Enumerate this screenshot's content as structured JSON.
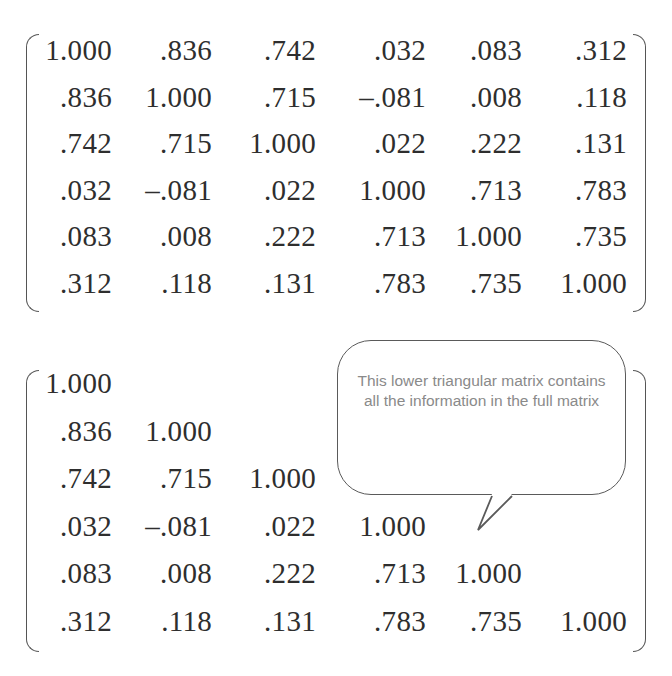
{
  "full_matrix": {
    "rows": [
      [
        "1.000",
        ".836",
        ".742",
        ".032",
        ".083",
        ".312"
      ],
      [
        ".836",
        "1.000",
        ".715",
        "–.081",
        ".008",
        ".118"
      ],
      [
        ".742",
        ".715",
        "1.000",
        ".022",
        ".222",
        ".131"
      ],
      [
        ".032",
        "–.081",
        ".022",
        "1.000",
        ".713",
        ".783"
      ],
      [
        ".083",
        ".008",
        ".222",
        ".713",
        "1.000",
        ".735"
      ],
      [
        ".312",
        ".118",
        ".131",
        ".783",
        ".735",
        "1.000"
      ]
    ]
  },
  "lower_triangular_matrix": {
    "rows": [
      [
        "1.000"
      ],
      [
        ".836",
        "1.000"
      ],
      [
        ".742",
        ".715",
        "1.000"
      ],
      [
        ".032",
        "–.081",
        ".022",
        "1.000"
      ],
      [
        ".083",
        ".008",
        ".222",
        ".713",
        "1.000"
      ],
      [
        ".312",
        ".118",
        ".131",
        ".783",
        ".735",
        "1.000"
      ]
    ]
  },
  "callout": {
    "text": "This lower triangular matrix contains all the information in the full matrix"
  },
  "colors": {
    "text": "#2e2e2e",
    "callout_text": "#8a8a8a",
    "callout_border": "#5a5a5a",
    "bracket": "#555555"
  }
}
